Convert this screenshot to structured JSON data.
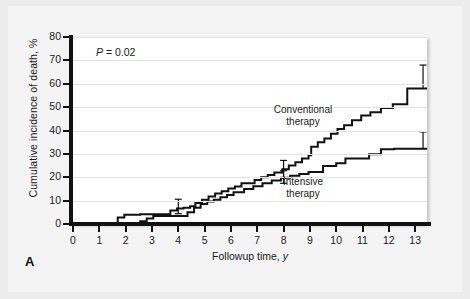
{
  "figure": {
    "panel_letter": "A",
    "p_value_text": "P = 0.02",
    "p_value_italic": "P",
    "p_value_rest": " = 0.02"
  },
  "chart_data": {
    "type": "line",
    "subtype": "step",
    "title": "",
    "xlabel": "Followup time, y",
    "xlabel_italic_part": "y",
    "ylabel": "Cumulative incidence of death, %",
    "xlim": [
      0,
      13.45
    ],
    "ylim": [
      0,
      80
    ],
    "xticks": [
      0,
      1,
      2,
      3,
      4,
      5,
      6,
      7,
      8,
      9,
      10,
      11,
      12,
      13
    ],
    "xticklabels": [
      "0",
      "1",
      "2",
      "3",
      "4",
      "5",
      "6",
      "7",
      "8",
      "9",
      "10",
      "11",
      "12",
      "13"
    ],
    "yticks": [
      0,
      10,
      20,
      30,
      40,
      50,
      60,
      70,
      80
    ],
    "yticklabels": [
      "0",
      "10",
      "20",
      "30",
      "40",
      "50",
      "60",
      "70",
      "80"
    ],
    "grid": "horizontal",
    "legend_position": "inline-annotation",
    "annotations": [
      {
        "name": "p-value",
        "text": "P = 0.02",
        "x": 0.9,
        "y": 76
      },
      {
        "name": "conventional-label",
        "text": "Conventional\ntherapy",
        "x": 8.0,
        "y": 45
      },
      {
        "name": "intensive-label",
        "text": "Intensive\ntherapy",
        "x": 8.0,
        "y": 20
      }
    ],
    "series": [
      {
        "name": "Conventional therapy",
        "color": "#111111",
        "x": [
          0,
          1.7,
          1.7,
          1.95,
          1.95,
          2.55,
          2.55,
          3.7,
          3.7,
          3.95,
          3.95,
          4.2,
          4.2,
          4.45,
          4.45,
          4.65,
          4.65,
          4.9,
          4.9,
          5.15,
          5.15,
          5.4,
          5.4,
          5.65,
          5.65,
          5.9,
          5.9,
          6.15,
          6.15,
          6.4,
          6.4,
          6.9,
          6.9,
          7.15,
          7.15,
          7.4,
          7.4,
          7.65,
          7.65,
          7.95,
          7.95,
          8.2,
          8.2,
          8.45,
          8.45,
          8.7,
          8.7,
          8.95,
          8.95,
          9.05,
          9.05,
          9.3,
          9.3,
          9.55,
          9.55,
          9.8,
          9.8,
          10.05,
          10.05,
          10.3,
          10.3,
          10.6,
          10.6,
          10.95,
          10.95,
          11.3,
          11.3,
          11.7,
          11.7,
          12.15,
          12.15,
          12.7,
          12.7,
          13.45
        ],
        "y": [
          0,
          0,
          2.8,
          2.8,
          4.0,
          4.0,
          4.2,
          4.2,
          5.8,
          5.8,
          6.6,
          6.6,
          7.0,
          7.0,
          7.6,
          7.6,
          9.0,
          9.0,
          10.4,
          10.4,
          11.8,
          11.8,
          13.0,
          13.0,
          14.0,
          14.0,
          15.2,
          15.2,
          16.0,
          16.0,
          17.4,
          17.4,
          18.8,
          18.8,
          20.0,
          20.0,
          21.0,
          21.0,
          22.0,
          22.0,
          23.4,
          23.4,
          25.0,
          25.0,
          26.4,
          26.4,
          28.0,
          28.0,
          29.4,
          29.4,
          33.0,
          33.0,
          35.0,
          35.0,
          36.6,
          36.6,
          38.6,
          38.6,
          40.6,
          40.6,
          42.2,
          42.2,
          44.4,
          44.4,
          46.4,
          46.4,
          47.8,
          47.8,
          49.6,
          49.6,
          51.2,
          51.2,
          58.0,
          58.0
        ],
        "final_value": 58.0
      },
      {
        "name": "Intensive therapy",
        "color": "#111111",
        "x": [
          0,
          2.55,
          2.55,
          2.8,
          2.8,
          3.05,
          3.05,
          4.35,
          4.35,
          4.6,
          4.6,
          4.85,
          4.85,
          5.1,
          5.1,
          5.35,
          5.35,
          5.6,
          5.6,
          5.85,
          5.85,
          6.1,
          6.1,
          6.5,
          6.5,
          6.85,
          6.85,
          7.2,
          7.2,
          7.55,
          7.55,
          7.9,
          7.9,
          8.25,
          8.25,
          8.6,
          8.6,
          8.95,
          8.95,
          9.5,
          9.5,
          10.0,
          10.0,
          10.35,
          10.35,
          11.25,
          11.25,
          11.7,
          11.7,
          12.2,
          12.2,
          13.45
        ],
        "y": [
          0,
          0,
          1.2,
          1.2,
          2.4,
          2.4,
          3.4,
          3.4,
          5.0,
          5.0,
          7.0,
          7.0,
          8.6,
          8.6,
          9.6,
          9.6,
          10.4,
          10.4,
          11.4,
          11.4,
          12.4,
          12.4,
          13.6,
          13.6,
          15.0,
          15.0,
          16.2,
          16.2,
          17.4,
          17.4,
          18.6,
          18.6,
          19.8,
          19.8,
          20.6,
          20.6,
          21.4,
          21.4,
          22.2,
          22.2,
          24.8,
          24.8,
          26.0,
          26.0,
          28.0,
          28.0,
          29.8,
          29.8,
          32.0,
          32.0,
          32.2,
          32.2
        ],
        "final_value": 32.2
      }
    ],
    "error_bars": [
      {
        "series": "Conventional therapy",
        "x": 4.0,
        "y": 7.0,
        "upper": 10.6,
        "lower": 4.4
      },
      {
        "series": "Conventional therapy",
        "x": 8.0,
        "y": 23.0,
        "upper": 27.2,
        "lower": 19.8
      },
      {
        "series": "Conventional therapy",
        "x": 13.3,
        "y": 58.0,
        "upper": 68.0,
        "lower": 58.0
      },
      {
        "series": "Intensive therapy",
        "x": 8.0,
        "y": 20.0,
        "upper": 22.8,
        "lower": 17.4
      },
      {
        "series": "Intensive therapy",
        "x": 13.3,
        "y": 32.2,
        "upper": 39.4,
        "lower": 32.2
      }
    ]
  }
}
